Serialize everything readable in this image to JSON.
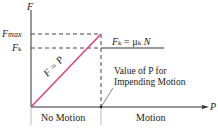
{
  "diagram": {
    "type": "friction-force-vs-applied-force",
    "axes": {
      "y_label": "F",
      "x_label": "P"
    },
    "y_ticks": [
      {
        "label_main": "F",
        "label_sub": "max"
      },
      {
        "label_main": "F",
        "label_sub": "k"
      }
    ],
    "line_label": "F = P",
    "kinetic_label": {
      "lhs": "F",
      "lhs_sub": "k",
      "eq": " = μ",
      "mu_sub": "k",
      "rhs": " N"
    },
    "annotation": {
      "line1": "Value of P for",
      "line2": "Impending Motion"
    },
    "regions": [
      "No Motion",
      "Motion"
    ],
    "colors": {
      "static_line": "#d9477a",
      "axes": "#333333",
      "dashed": "#444444"
    }
  }
}
